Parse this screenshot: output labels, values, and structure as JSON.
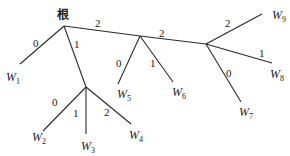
{
  "diagram": {
    "type": "ternary-huffman-tree",
    "root": {
      "label": "根",
      "x": 64,
      "y": 26,
      "label_x": 57,
      "label_y": 19
    },
    "internal_nodes": [
      {
        "id": "A",
        "x": 86,
        "y": 87
      },
      {
        "id": "B",
        "x": 140,
        "y": 36
      },
      {
        "id": "C",
        "x": 206,
        "y": 44
      }
    ],
    "edges": [
      {
        "from": [
          64,
          26
        ],
        "to": [
          20,
          64
        ],
        "label": "0",
        "lx": 33,
        "ly": 47
      },
      {
        "from": [
          64,
          26
        ],
        "to": [
          86,
          87
        ],
        "label": "1",
        "lx": 74,
        "ly": 48
      },
      {
        "from": [
          64,
          26
        ],
        "to": [
          140,
          36
        ],
        "label": "2",
        "lx": 95,
        "ly": 27
      },
      {
        "from": [
          86,
          87
        ],
        "to": [
          43,
          131
        ],
        "label": "0",
        "lx": 52,
        "ly": 106
      },
      {
        "from": [
          86,
          87
        ],
        "to": [
          86,
          134
        ],
        "label": "1",
        "lx": 73,
        "ly": 117
      },
      {
        "from": [
          86,
          87
        ],
        "to": [
          131,
          124
        ],
        "label": "2",
        "lx": 104,
        "ly": 116
      },
      {
        "from": [
          140,
          36
        ],
        "to": [
          118,
          84
        ],
        "label": "0",
        "lx": 116,
        "ly": 67
      },
      {
        "from": [
          140,
          36
        ],
        "to": [
          173,
          82
        ],
        "label": "1",
        "lx": 150,
        "ly": 67
      },
      {
        "from": [
          140,
          36
        ],
        "to": [
          206,
          44
        ],
        "label": "2",
        "lx": 159,
        "ly": 37
      },
      {
        "from": [
          206,
          44
        ],
        "to": [
          262,
          14
        ],
        "label": "2",
        "lx": 225,
        "ly": 27
      },
      {
        "from": [
          206,
          44
        ],
        "to": [
          272,
          63
        ],
        "label": "1",
        "lx": 259,
        "ly": 57
      },
      {
        "from": [
          206,
          44
        ],
        "to": [
          241,
          102
        ],
        "label": "0",
        "lx": 226,
        "ly": 77
      }
    ],
    "leaves": [
      {
        "name": "W",
        "sub": "1",
        "x": 6,
        "y": 81
      },
      {
        "name": "W",
        "sub": "2",
        "x": 32,
        "y": 141
      },
      {
        "name": "W",
        "sub": "3",
        "x": 81,
        "y": 150
      },
      {
        "name": "W",
        "sub": "4",
        "x": 129,
        "y": 139
      },
      {
        "name": "W",
        "sub": "5",
        "x": 117,
        "y": 98
      },
      {
        "name": "W",
        "sub": "6",
        "x": 172,
        "y": 96
      },
      {
        "name": "W",
        "sub": "7",
        "x": 239,
        "y": 116
      },
      {
        "name": "W",
        "sub": "8",
        "x": 270,
        "y": 78
      },
      {
        "name": "W",
        "sub": "9",
        "x": 272,
        "y": 19
      }
    ]
  }
}
